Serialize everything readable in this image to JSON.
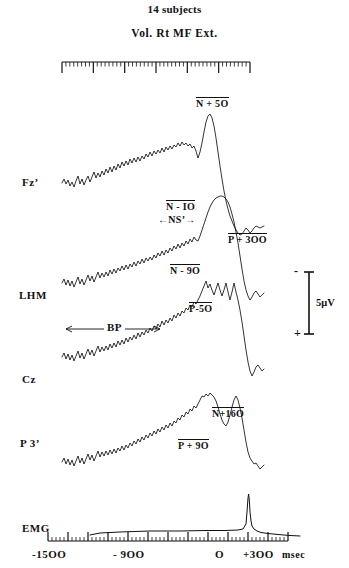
{
  "header": {
    "line1": "14 subjects",
    "line2": "Vol. Rt MF Ext."
  },
  "channels": [
    {
      "id": "fz",
      "label": "Fz’"
    },
    {
      "id": "lhm",
      "label": "LHM"
    },
    {
      "id": "cz",
      "label": "Cz"
    },
    {
      "id": "p3",
      "label": "P 3’"
    },
    {
      "id": "emg",
      "label": "EMG"
    }
  ],
  "annotations": {
    "n_plus_50": "N + 5O",
    "n_minus_10": "N - IO",
    "ns_prime": "NS’",
    "n_minus_90": "N - 9O",
    "p_plus_300": "P + 3OO",
    "p_minus_50": "P-5O",
    "bp": "BP",
    "n_plus_160": "N+16O",
    "p_plus_90": "P + 9O"
  },
  "calibration": {
    "amplitude": "5μV",
    "negative_sign": "-",
    "positive_sign": "+"
  },
  "xaxis": {
    "ticks": [
      {
        "value": -1500,
        "label": "-15OO"
      },
      {
        "value": -900,
        "label": "- 9OO"
      },
      {
        "value": 0,
        "label": "O"
      },
      {
        "value": 300,
        "label": "+3OO"
      }
    ],
    "unit": "msec"
  },
  "colors": {
    "ink": "#111111",
    "background": "#ffffff"
  },
  "chart_data": {
    "type": "line",
    "xlabel": "msec",
    "ylabel": "5μV",
    "xlim": [
      -1500,
      400
    ],
    "grid": false,
    "legend": "none",
    "series": [
      {
        "name": "Fz’",
        "components": [
          {
            "label": "N + 5O",
            "latency_ms": 50,
            "polarity": "negative"
          },
          {
            "label": "P + 3OO",
            "latency_ms": 300,
            "polarity": "positive"
          }
        ]
      },
      {
        "name": "LHM",
        "components": [
          {
            "label": "N - IO",
            "latency_ms": -10,
            "polarity": "negative"
          },
          {
            "label": "NS’",
            "latency_ms": -400,
            "polarity": "negative"
          }
        ]
      },
      {
        "name": "Cz",
        "components": [
          {
            "label": "N - 9O",
            "latency_ms": -90,
            "polarity": "negative"
          },
          {
            "label": "P-5O",
            "latency_ms": -50,
            "polarity": "positive"
          },
          {
            "label": "BP",
            "latency_ms": -1200,
            "polarity": "negative"
          }
        ]
      },
      {
        "name": "P 3’",
        "components": [
          {
            "label": "P + 9O",
            "latency_ms": 90,
            "polarity": "positive"
          },
          {
            "label": "N+16O",
            "latency_ms": 160,
            "polarity": "negative"
          }
        ]
      },
      {
        "name": "EMG",
        "components": [
          {
            "label": "onset",
            "latency_ms": 0,
            "polarity": "rectified"
          }
        ]
      }
    ]
  }
}
